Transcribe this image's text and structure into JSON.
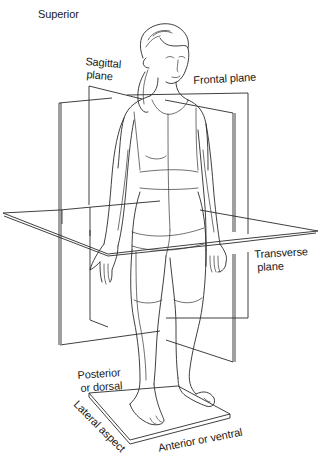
{
  "figure": {
    "type": "anatomical-planes-illustration",
    "colors": {
      "background": "#ffffff",
      "line": "#2a2a2a",
      "text": "#1a1a1a"
    }
  },
  "labels": {
    "superior": "Superior",
    "sagittal_line1": "Sagittal",
    "sagittal_line2": "plane",
    "frontal": "Frontal plane",
    "transverse_line1": "Transverse",
    "transverse_line2": "plane",
    "posterior_line1": "Posterior",
    "posterior_line2": "or dorsal",
    "lateral": "Lateral aspect",
    "anterior": "Anterior or ventral"
  }
}
